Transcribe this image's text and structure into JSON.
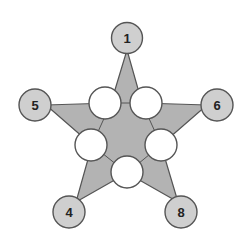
{
  "diagram": {
    "type": "magic-star-puzzle",
    "colors": {
      "star_fill": "#b3b3b3",
      "outline": "#555555",
      "outer_circle_fill": "#cfcfcf",
      "inner_circle_fill": "#ffffff",
      "text": "#222222"
    },
    "outer_nodes": [
      {
        "id": "top",
        "label": "1"
      },
      {
        "id": "left",
        "label": "5"
      },
      {
        "id": "right",
        "label": "6"
      },
      {
        "id": "bottom-left",
        "label": "4"
      },
      {
        "id": "bottom-right",
        "label": "8"
      }
    ],
    "inner_nodes": [
      {
        "id": "upper-left",
        "label": ""
      },
      {
        "id": "upper-right",
        "label": ""
      },
      {
        "id": "middle-left",
        "label": ""
      },
      {
        "id": "middle-right",
        "label": ""
      },
      {
        "id": "bottom",
        "label": ""
      }
    ]
  }
}
